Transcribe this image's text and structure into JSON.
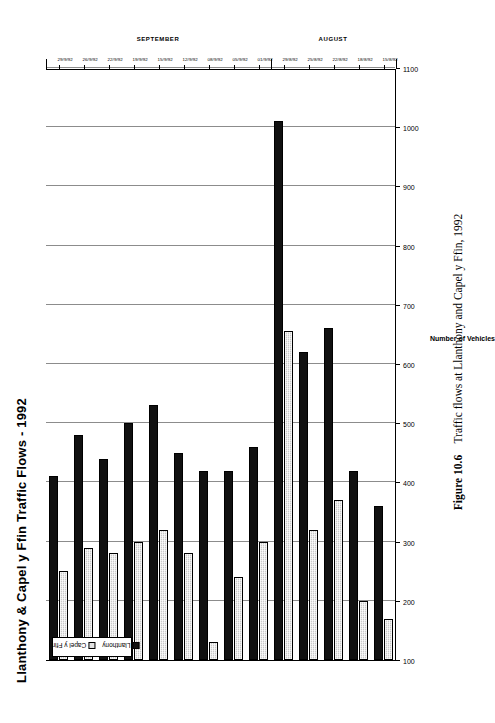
{
  "figure": {
    "caption_label": "Figure 10.6",
    "caption_text": "Traffic flows at Llanthony and Capel y Ffin, 1992"
  },
  "chart_data": {
    "type": "bar",
    "orientation": "horizontal",
    "title": "Llanthony & Capel y Ffin Traffic Flows - 1992",
    "xlabel": "Number of Vehicles",
    "ylabel": "",
    "xlim": [
      100,
      1100
    ],
    "xticks": [
      1100,
      1000,
      900,
      800,
      700,
      600,
      500,
      400,
      300,
      200,
      100
    ],
    "grid": true,
    "legend_position": "upper-left-inside",
    "categories": [
      "29/9/92",
      "26/9/92",
      "22/9/92",
      "19/9/92",
      "15/9/92",
      "12/9/92",
      "08/9/92",
      "05/9/92",
      "01/9/92",
      "29/8/92",
      "25/8/92",
      "22/8/92",
      "18/8/92",
      "15/8/92"
    ],
    "group_labels": [
      "SEPTEMBER",
      "AUGUST"
    ],
    "series": [
      {
        "name": "Llanthony",
        "color": "#111111",
        "values": [
          410,
          480,
          440,
          500,
          530,
          450,
          420,
          420,
          460,
          1010,
          620,
          660,
          420,
          360
        ]
      },
      {
        "name": "Capel y Ffin",
        "color": "#c9c9c9",
        "values": [
          250,
          290,
          280,
          300,
          320,
          280,
          130,
          240,
          300,
          655,
          320,
          370,
          200,
          170
        ]
      }
    ]
  },
  "legend": {
    "items": [
      {
        "label": "Llanthony",
        "swatch": "filled-black-swatch"
      },
      {
        "label": "Capel y Ffin",
        "swatch": "light-grey-swatch"
      }
    ]
  }
}
